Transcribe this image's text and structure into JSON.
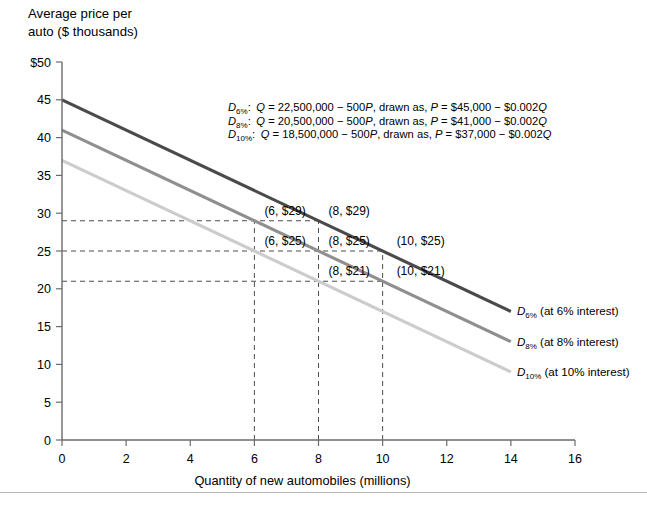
{
  "chart_data": {
    "type": "line",
    "title": "",
    "ylabel_line1": "Average price per",
    "ylabel_line2": "auto ($ thousands)",
    "xlabel": "Quantity of new automobiles (millions)",
    "xlim": [
      0,
      16
    ],
    "ylim": [
      0,
      50
    ],
    "xticks": [
      0,
      2,
      4,
      6,
      8,
      10,
      12,
      14,
      16
    ],
    "xticklabels": [
      "0",
      "2",
      "4",
      "6",
      "8",
      "10",
      "12",
      "14",
      "16"
    ],
    "yticks": [
      0,
      5,
      10,
      15,
      20,
      25,
      30,
      35,
      40,
      45,
      50
    ],
    "yticklabels": [
      "0",
      "5",
      "10",
      "15",
      "20",
      "25",
      "30",
      "35",
      "40",
      "45",
      "$50"
    ],
    "grid": false,
    "legend_position": "right-inline",
    "series": [
      {
        "name": "D6",
        "label_prefix": "D",
        "label_sub": "6%",
        "label_suffix": " (at 6% interest)",
        "color": "#4a4a4a",
        "intercept": 45,
        "slope": -2,
        "x": [
          0,
          14
        ],
        "y": [
          45,
          17
        ]
      },
      {
        "name": "D8",
        "label_prefix": "D",
        "label_sub": "8%",
        "label_suffix": " (at 8% interest)",
        "color": "#8f8f8f",
        "intercept": 41,
        "slope": -2,
        "x": [
          0,
          14
        ],
        "y": [
          41,
          13
        ]
      },
      {
        "name": "D10",
        "label_prefix": "D",
        "label_sub": "10%",
        "label_suffix": " (at 10% interest)",
        "color": "#cccccc",
        "intercept": 37,
        "slope": -2,
        "x": [
          0,
          14
        ],
        "y": [
          37,
          9
        ]
      }
    ],
    "annotations": [
      {
        "text": "(6, $29)",
        "x": 6,
        "y": 29,
        "dx": 10,
        "dy": -6
      },
      {
        "text": "(8, $29)",
        "x": 8,
        "y": 29,
        "dx": 10,
        "dy": -6
      },
      {
        "text": "(6, $25)",
        "x": 6,
        "y": 25,
        "dx": 10,
        "dy": -6
      },
      {
        "text": "(8, $25)",
        "x": 8,
        "y": 25,
        "dx": 10,
        "dy": -6
      },
      {
        "text": "(10, $25)",
        "x": 10,
        "y": 25,
        "dx": 14,
        "dy": -6
      },
      {
        "text": "(8, $21)",
        "x": 8,
        "y": 21,
        "dx": 10,
        "dy": -6
      },
      {
        "text": "(10, $21)",
        "x": 10,
        "y": 21,
        "dx": 14,
        "dy": -6
      }
    ],
    "guide_lines": {
      "horizontal": [
        {
          "y": 29,
          "x_from": 0,
          "x_to": 8
        },
        {
          "y": 25,
          "x_from": 0,
          "x_to": 10
        },
        {
          "y": 21,
          "x_from": 0,
          "x_to": 10
        }
      ],
      "vertical": [
        {
          "x": 6,
          "y_from": 0,
          "y_to": 29
        },
        {
          "x": 8,
          "y_from": 0,
          "y_to": 29
        },
        {
          "x": 10,
          "y_from": 0,
          "y_to": 25
        }
      ]
    },
    "equations": [
      {
        "d_label": "D",
        "d_sub": "6%",
        "colon": ":",
        "body": "Q = 22,500,000 − 500P, drawn as, P = $45,000 − $0.002Q"
      },
      {
        "d_label": "D",
        "d_sub": "8%",
        "colon": ":",
        "body": "Q = 20,500,000 − 500P, drawn as, P = $41,000 − $0.002Q"
      },
      {
        "d_label": "D",
        "d_sub": "10%",
        "colon": ":",
        "body": "Q = 18,500,000 − 500P, drawn as, P = $37,000 − $0.002Q"
      }
    ]
  },
  "colors": {
    "axis": "#6b6b6b",
    "dash": "#4d4d4d",
    "curve_dark": "#4a4a4a",
    "curve_mid": "#8f8f8f",
    "curve_light": "#cccccc",
    "footer_rule": "#b9b9b9"
  }
}
